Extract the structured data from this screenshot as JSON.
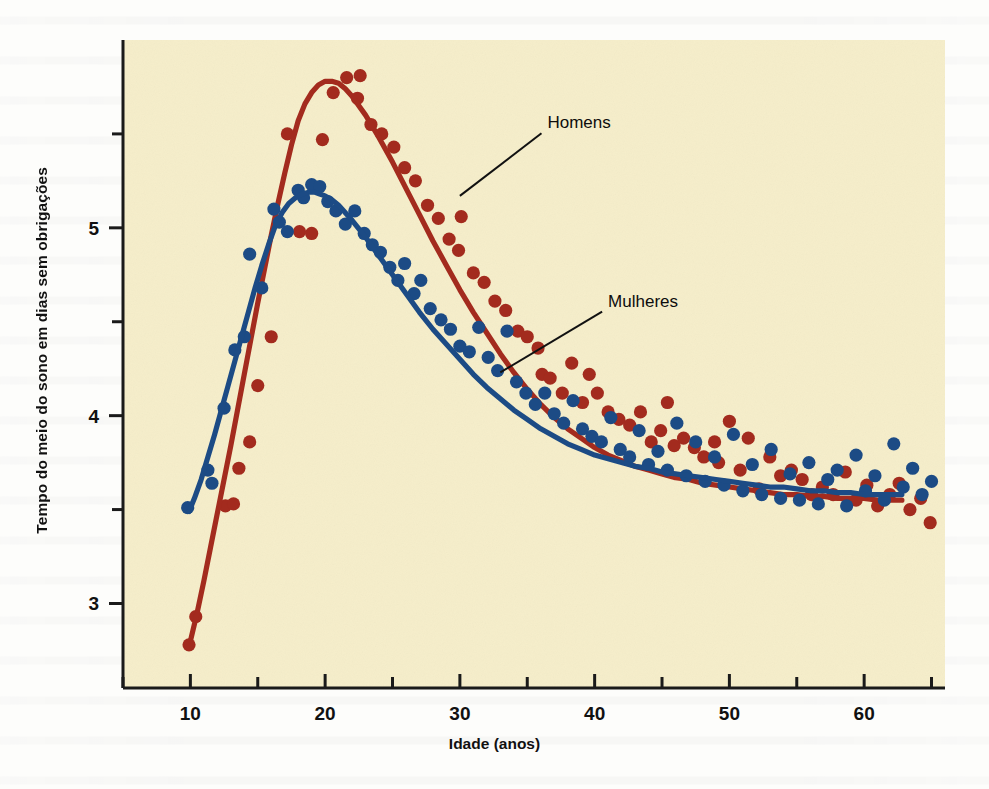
{
  "chart_data": {
    "type": "scatter",
    "title": "",
    "xlabel": "Idade (anos)",
    "ylabel": "Tempo do meio do sono em dias sem obrigações",
    "xlim": [
      5,
      66
    ],
    "ylim": [
      2.55,
      6.0
    ],
    "grid": false,
    "legend_position": "inline-annotations",
    "xticks_major": [
      10,
      20,
      30,
      40,
      50,
      60
    ],
    "xticks_minor": [
      5,
      15,
      25,
      35,
      45,
      55,
      65
    ],
    "yticks_major": [
      3,
      4,
      5
    ],
    "yticks_minor": [
      3.5,
      4.5,
      5.5
    ],
    "xtick_labels": [
      "10",
      "20",
      "30",
      "40",
      "50",
      "60"
    ],
    "ytick_labels": [
      "3",
      "4",
      "5"
    ],
    "annotations": [
      {
        "text": "Homens",
        "x_data": 36.5,
        "y_data": 5.53,
        "points_to_x": 30.0,
        "points_to_y": 5.17
      },
      {
        "text": "Mulheres",
        "x_data": 41.0,
        "y_data": 4.58,
        "points_to_x": 33.0,
        "points_to_y": 4.23
      }
    ],
    "series": [
      {
        "name": "Homens",
        "color": "#A32B1E",
        "marker": "circle",
        "curve_x": [
          10.0,
          10.5,
          11.0,
          11.5,
          12.0,
          12.5,
          13.0,
          13.5,
          14.0,
          14.5,
          15.0,
          15.5,
          16.0,
          16.5,
          17.0,
          17.5,
          18.0,
          18.5,
          19.0,
          19.5,
          20.0,
          20.5,
          21.0,
          21.5,
          22.0,
          23.0,
          24.0,
          25.0,
          26.0,
          27.0,
          28.0,
          29.0,
          30.0,
          31.0,
          32.0,
          33.0,
          34.0,
          35.0,
          36.0,
          37.0,
          38.0,
          39.0,
          40.0,
          41.0,
          42.0,
          43.0,
          44.0,
          45.0,
          46.0,
          47.0,
          48.0,
          49.0,
          50.0,
          51.0,
          52.0,
          53.0,
          54.0,
          55.0,
          56.0,
          57.0,
          58.0,
          59.0,
          60.0,
          61.0,
          62.0,
          62.8
        ],
        "curve_y": [
          2.8,
          2.95,
          3.12,
          3.3,
          3.48,
          3.66,
          3.84,
          4.03,
          4.22,
          4.41,
          4.6,
          4.78,
          4.96,
          5.13,
          5.29,
          5.44,
          5.57,
          5.66,
          5.72,
          5.76,
          5.78,
          5.78,
          5.77,
          5.74,
          5.7,
          5.6,
          5.48,
          5.35,
          5.21,
          5.07,
          4.93,
          4.8,
          4.67,
          4.55,
          4.44,
          4.33,
          4.23,
          4.14,
          4.06,
          3.99,
          3.93,
          3.88,
          3.83,
          3.79,
          3.76,
          3.73,
          3.71,
          3.69,
          3.67,
          3.66,
          3.64,
          3.63,
          3.62,
          3.61,
          3.6,
          3.59,
          3.58,
          3.58,
          3.57,
          3.57,
          3.56,
          3.56,
          3.56,
          3.55,
          3.55,
          3.55
        ],
        "points_x": [
          9.9,
          10.4,
          12.6,
          13.2,
          13.6,
          14.4,
          15.0,
          16.0,
          17.2,
          18.1,
          19.0,
          19.8,
          20.6,
          21.6,
          22.4,
          22.6,
          23.4,
          24.2,
          25.1,
          25.9,
          26.7,
          27.6,
          28.4,
          29.2,
          29.9,
          30.1,
          31.0,
          31.8,
          32.6,
          33.4,
          34.3,
          35.0,
          35.8,
          36.1,
          36.7,
          37.6,
          38.3,
          39.1,
          39.6,
          40.2,
          41.0,
          41.8,
          42.6,
          43.4,
          44.2,
          44.9,
          45.4,
          45.9,
          46.6,
          47.4,
          48.1,
          48.9,
          49.2,
          50.0,
          50.8,
          51.4,
          52.2,
          53.0,
          53.8,
          54.6,
          55.4,
          56.1,
          56.9,
          57.7,
          58.6,
          59.4,
          60.2,
          61.0,
          61.9,
          62.6,
          63.4,
          64.2,
          64.9
        ],
        "points_y": [
          2.78,
          2.93,
          3.52,
          3.53,
          3.72,
          3.86,
          4.16,
          4.42,
          5.5,
          4.98,
          4.97,
          5.47,
          5.72,
          5.8,
          5.69,
          5.81,
          5.55,
          5.5,
          5.43,
          5.32,
          5.25,
          5.12,
          5.05,
          4.94,
          4.88,
          5.06,
          4.76,
          4.71,
          4.61,
          4.56,
          4.45,
          4.42,
          4.36,
          4.22,
          4.2,
          4.12,
          4.28,
          4.07,
          4.22,
          4.12,
          4.02,
          3.98,
          3.95,
          4.02,
          3.86,
          3.92,
          4.07,
          3.84,
          3.88,
          3.83,
          3.78,
          3.86,
          3.75,
          3.97,
          3.71,
          3.88,
          3.61,
          3.78,
          3.68,
          3.71,
          3.66,
          3.58,
          3.62,
          3.58,
          3.7,
          3.55,
          3.63,
          3.52,
          3.58,
          3.64,
          3.5,
          3.56,
          3.43
        ]
      },
      {
        "name": "Mulheres",
        "color": "#1C4B85",
        "marker": "circle",
        "curve_x": [
          9.9,
          10.3,
          10.8,
          11.3,
          11.8,
          12.3,
          12.8,
          13.3,
          13.8,
          14.3,
          14.8,
          15.3,
          15.8,
          16.3,
          16.8,
          17.3,
          17.8,
          18.3,
          18.8,
          19.2,
          19.6,
          20.0,
          20.5,
          21.0,
          22.0,
          23.0,
          24.0,
          25.0,
          26.0,
          27.0,
          28.0,
          29.0,
          30.0,
          31.0,
          32.0,
          33.0,
          34.0,
          35.0,
          36.0,
          37.0,
          38.0,
          39.0,
          40.0,
          41.0,
          42.0,
          43.0,
          44.0,
          45.0,
          46.0,
          47.0,
          48.0,
          49.0,
          50.0,
          51.0,
          52.0,
          53.0,
          54.0,
          55.0,
          56.0,
          57.0,
          58.0,
          59.0,
          60.0,
          61.0,
          62.0,
          62.8
        ],
        "curve_y": [
          3.49,
          3.56,
          3.66,
          3.78,
          3.9,
          4.03,
          4.16,
          4.29,
          4.42,
          4.55,
          4.68,
          4.8,
          4.91,
          5.01,
          5.08,
          5.13,
          5.16,
          5.18,
          5.19,
          5.19,
          5.18,
          5.17,
          5.15,
          5.12,
          5.04,
          4.95,
          4.85,
          4.75,
          4.65,
          4.55,
          4.46,
          4.38,
          4.3,
          4.22,
          4.15,
          4.09,
          4.03,
          3.98,
          3.93,
          3.89,
          3.85,
          3.82,
          3.79,
          3.77,
          3.75,
          3.73,
          3.72,
          3.7,
          3.69,
          3.68,
          3.67,
          3.66,
          3.65,
          3.64,
          3.63,
          3.62,
          3.62,
          3.61,
          3.6,
          3.6,
          3.59,
          3.59,
          3.58,
          3.58,
          3.58,
          3.58
        ],
        "points_x": [
          9.8,
          11.3,
          11.6,
          12.5,
          13.3,
          14.0,
          14.4,
          15.3,
          16.2,
          16.6,
          17.2,
          18.0,
          18.4,
          19.0,
          19.6,
          20.2,
          20.8,
          21.5,
          22.2,
          22.9,
          23.5,
          24.1,
          24.8,
          25.4,
          25.9,
          26.6,
          27.1,
          27.8,
          28.6,
          29.3,
          30.0,
          30.7,
          31.4,
          32.1,
          32.8,
          33.5,
          34.2,
          34.9,
          35.6,
          36.3,
          37.0,
          37.7,
          38.4,
          39.1,
          39.8,
          40.5,
          41.2,
          41.9,
          42.6,
          43.3,
          44.0,
          44.7,
          45.4,
          46.1,
          46.8,
          47.5,
          48.2,
          48.9,
          49.6,
          50.3,
          51.0,
          51.7,
          52.4,
          53.1,
          53.8,
          54.5,
          55.2,
          55.9,
          56.6,
          57.3,
          58.0,
          58.7,
          59.4,
          60.1,
          60.8,
          61.5,
          62.2,
          62.9,
          63.6,
          64.3,
          65.0
        ],
        "points_y": [
          3.51,
          3.71,
          3.64,
          4.04,
          4.35,
          4.42,
          4.86,
          4.68,
          5.1,
          5.03,
          4.98,
          5.2,
          5.16,
          5.23,
          5.22,
          5.14,
          5.09,
          5.02,
          5.09,
          4.97,
          4.91,
          4.87,
          4.79,
          4.72,
          4.81,
          4.65,
          4.72,
          4.57,
          4.51,
          4.46,
          4.37,
          4.34,
          4.47,
          4.31,
          4.24,
          4.45,
          4.18,
          4.12,
          4.06,
          4.12,
          4.01,
          3.96,
          4.08,
          3.93,
          3.89,
          3.86,
          3.99,
          3.82,
          3.78,
          3.92,
          3.74,
          3.81,
          3.71,
          3.96,
          3.68,
          3.86,
          3.65,
          3.78,
          3.63,
          3.9,
          3.6,
          3.74,
          3.58,
          3.82,
          3.56,
          3.69,
          3.55,
          3.75,
          3.53,
          3.66,
          3.71,
          3.52,
          3.79,
          3.6,
          3.68,
          3.55,
          3.85,
          3.62,
          3.72,
          3.58,
          3.65
        ]
      }
    ],
    "colors": {
      "men": "#A32B1E",
      "women": "#1C4B85",
      "plot_background": "#F6EECA",
      "axis": "#1a1a1a",
      "page_background": "#fdfdfb"
    }
  }
}
